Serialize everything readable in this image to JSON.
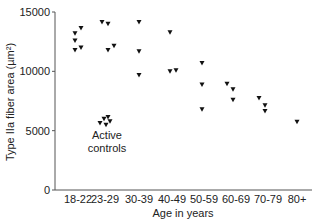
{
  "chart_data": {
    "type": "scatter",
    "title": "",
    "xlabel": "Age in years",
    "ylabel": "Type IIa fiber area (µm²)",
    "ylim": [
      0,
      15000
    ],
    "yticks": [
      0,
      5000,
      10000,
      15000
    ],
    "categories": [
      "18-22",
      "23-29",
      "30-39",
      "40-49",
      "50-59",
      "60-69",
      "70-79",
      "80+"
    ],
    "grid": false,
    "marker": "triangle-down",
    "annotations": [
      {
        "text": "Active controls",
        "category": "23-29",
        "y": 5000
      }
    ],
    "series": [
      {
        "name": "Subjects",
        "points": [
          {
            "category": "18-22",
            "offset": -3,
            "y": 13200
          },
          {
            "category": "18-22",
            "offset": 3,
            "y": 13650
          },
          {
            "category": "18-22",
            "offset": -3,
            "y": 12600
          },
          {
            "category": "18-22",
            "offset": -3,
            "y": 11800
          },
          {
            "category": "18-22",
            "offset": 3,
            "y": 12000
          },
          {
            "category": "23-29",
            "offset": -3,
            "y": 14150
          },
          {
            "category": "23-29",
            "offset": 3,
            "y": 14000
          },
          {
            "category": "23-29",
            "offset": 3,
            "y": 11800
          },
          {
            "category": "23-29",
            "offset": 9,
            "y": 12150
          },
          {
            "category": "30-39",
            "offset": 0,
            "y": 14150
          },
          {
            "category": "30-39",
            "offset": 0,
            "y": 11700
          },
          {
            "category": "30-39",
            "offset": 0,
            "y": 9700
          },
          {
            "category": "40-49",
            "offset": -2,
            "y": 13300
          },
          {
            "category": "40-49",
            "offset": -2,
            "y": 10000
          },
          {
            "category": "40-49",
            "offset": 4,
            "y": 10100
          },
          {
            "category": "50-59",
            "offset": -2,
            "y": 10700
          },
          {
            "category": "50-59",
            "offset": -2,
            "y": 8900
          },
          {
            "category": "50-59",
            "offset": -2,
            "y": 6800
          },
          {
            "category": "60-69",
            "offset": -9,
            "y": 8950
          },
          {
            "category": "60-69",
            "offset": -3,
            "y": 8500
          },
          {
            "category": "60-69",
            "offset": -3,
            "y": 7600
          },
          {
            "category": "70-79",
            "offset": -9,
            "y": 7750
          },
          {
            "category": "70-79",
            "offset": -3,
            "y": 7150
          },
          {
            "category": "70-79",
            "offset": -3,
            "y": 6650
          },
          {
            "category": "80+",
            "offset": 0,
            "y": 5750
          }
        ]
      },
      {
        "name": "Active controls",
        "points": [
          {
            "category": "23-29",
            "offset": -1,
            "y": 6000
          },
          {
            "category": "23-29",
            "offset": 3,
            "y": 6150
          },
          {
            "category": "23-29",
            "offset": 5,
            "y": 5800
          },
          {
            "category": "23-29",
            "offset": -5,
            "y": 5650
          },
          {
            "category": "23-29",
            "offset": 1,
            "y": 5500
          }
        ]
      }
    ]
  }
}
